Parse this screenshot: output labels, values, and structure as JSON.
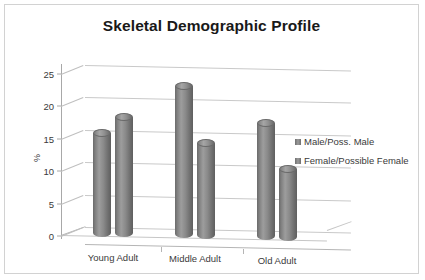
{
  "chart_data": {
    "type": "bar",
    "title": "Skeletal Demographic Profile",
    "xlabel": "",
    "ylabel": "%",
    "categories": [
      "Young Adult",
      "Middle Adult",
      "Old Adult"
    ],
    "series": [
      {
        "name": "Male/Poss. Male",
        "values": [
          16,
          23.5,
          18
        ]
      },
      {
        "name": "Female/Possible Female",
        "values": [
          18.5,
          14.8,
          11
        ]
      }
    ],
    "ylim": [
      0,
      25
    ],
    "yticks": [
      "0",
      "5",
      "10",
      "15",
      "20",
      "25"
    ],
    "grid": true,
    "legend_position": "right",
    "style_3d": true,
    "colors": {
      "bar_fill": "#8a8a8a",
      "bar_edge": "#6a6a6a",
      "gridline": "#c9c9c9",
      "axis": "#a8a8a8",
      "text": "#3a3a3a",
      "title": "#191919",
      "background": "#ffffff",
      "frame_border": "#d2d2d2"
    }
  },
  "legend": {
    "items": [
      {
        "label": "Male/Poss. Male"
      },
      {
        "label": "Female/Possible Female"
      }
    ]
  }
}
